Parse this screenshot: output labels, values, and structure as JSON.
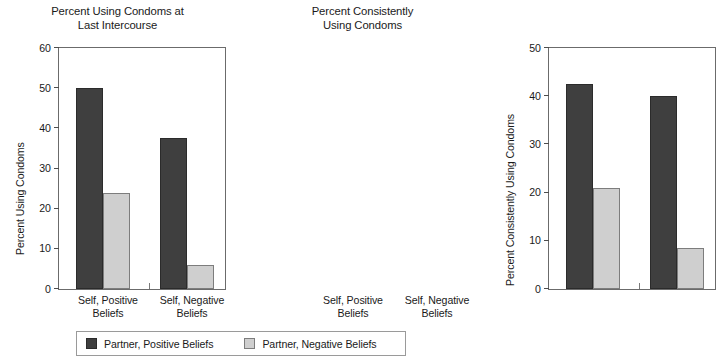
{
  "chart_data": [
    {
      "type": "bar",
      "panel": "left",
      "title": "Percent Using Condoms at Last Intercourse",
      "title_lines": [
        "Percent Using Condoms at",
        "Last Intercourse"
      ],
      "xlabel": "",
      "ylabel": "Percent Using Condoms",
      "ylim": [
        0,
        60
      ],
      "yticks": [
        0,
        10,
        20,
        30,
        40,
        50,
        60
      ],
      "ytick_labels": [
        "0",
        "10",
        "20",
        "30",
        "40",
        "50",
        "60"
      ],
      "grid": false,
      "legend_position": "bottom",
      "categories": [
        "Self, Positive Beliefs",
        "Self, Negative Beliefs"
      ],
      "category_lines": [
        [
          "Self, Positive",
          "Beliefs"
        ],
        [
          "Self, Negative",
          "Beliefs"
        ]
      ],
      "series": [
        {
          "name": "Partner, Positive Beliefs",
          "color": "#3f3f3f",
          "values": [
            50,
            37.5
          ]
        },
        {
          "name": "Partner, Negative Beliefs",
          "color": "#cfcfcf",
          "values": [
            24,
            6
          ]
        }
      ]
    },
    {
      "type": "bar",
      "panel": "right",
      "title": "Percent Consistently Using Condoms",
      "title_lines": [
        "Percent Consistently",
        "Using Condoms"
      ],
      "xlabel": "",
      "ylabel": "Percent Consistently Using Condoms",
      "ylim": [
        0,
        50
      ],
      "yticks": [
        0,
        10,
        20,
        30,
        40,
        50
      ],
      "ytick_labels": [
        "0",
        "10",
        "20",
        "30",
        "40",
        "50"
      ],
      "grid": false,
      "legend_position": "bottom",
      "categories": [
        "Self, Positive Beliefs",
        "Self, Negative Beliefs"
      ],
      "category_lines": [
        [
          "Self, Positive",
          "Beliefs"
        ],
        [
          "Self, Negative",
          "Beliefs"
        ]
      ],
      "series": [
        {
          "name": "Partner, Positive Beliefs",
          "color": "#3f3f3f",
          "values": [
            42.5,
            40
          ]
        },
        {
          "name": "Partner, Negative Beliefs",
          "color": "#cfcfcf",
          "values": [
            21,
            8.5
          ]
        }
      ]
    }
  ],
  "legend": {
    "entries": [
      {
        "label": "Partner, Positive Beliefs",
        "color": "#3f3f3f"
      },
      {
        "label": "Partner, Negative Beliefs",
        "color": "#cfcfcf"
      }
    ]
  },
  "colors": {
    "dark_bar": "#3f3f3f",
    "light_bar": "#cfcfcf",
    "axis": "#6b6b6b",
    "background": "#ffffff",
    "text": "#1a1a1a"
  }
}
